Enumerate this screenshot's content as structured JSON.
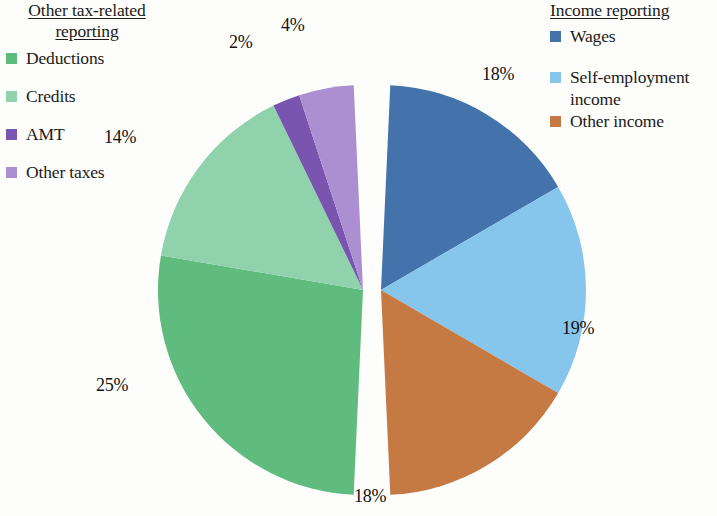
{
  "legend_left": {
    "title": "Other tax-related\nreporting",
    "items": [
      {
        "label": "Deductions",
        "color": "#60bb7e"
      },
      {
        "label": "Credits",
        "color": "#8fd2ac"
      },
      {
        "label": "AMT",
        "color": "#7a55b0"
      },
      {
        "label": "Other taxes",
        "color": "#ab8fd0"
      }
    ]
  },
  "legend_right": {
    "title": "Income reporting",
    "items": [
      {
        "label": "Wages",
        "color": "#4473ab"
      },
      {
        "label": "Self-employment\nincome",
        "color": "#86c5ec"
      },
      {
        "label": "Other income",
        "color": "#c57a44"
      }
    ]
  },
  "chart_data": {
    "type": "pie",
    "title": "",
    "legend_position": "left and right",
    "groups": [
      {
        "name": "Income reporting",
        "side": "right"
      },
      {
        "name": "Other tax-related reporting",
        "side": "left"
      }
    ],
    "categories": [
      "Wages",
      "Self-employment income",
      "Other income",
      "Deductions",
      "Credits",
      "AMT",
      "Other taxes"
    ],
    "values": [
      18,
      19,
      18,
      25,
      14,
      2,
      4
    ],
    "labels": [
      "18%",
      "19%",
      "18%",
      "25%",
      "14%",
      "2%",
      "4%"
    ],
    "colors": [
      "#4473ab",
      "#86c5ec",
      "#c57a44",
      "#60bb7e",
      "#8fd2ac",
      "#7a55b0",
      "#ab8fd0"
    ],
    "units": "percent",
    "total": 100
  },
  "pct_labels": [
    {
      "text": "18%",
      "x": 482,
      "y": 64,
      "name": "pct-label-wages"
    },
    {
      "text": "19%",
      "x": 562,
      "y": 318,
      "name": "pct-label-self-employment-income"
    },
    {
      "text": "18%",
      "x": 354,
      "y": 486,
      "name": "pct-label-other-income"
    },
    {
      "text": "25%",
      "x": 96,
      "y": 375,
      "name": "pct-label-deductions"
    },
    {
      "text": "14%",
      "x": 104,
      "y": 127,
      "name": "pct-label-credits"
    },
    {
      "text": "2%",
      "x": 229,
      "y": 32,
      "name": "pct-label-amt"
    },
    {
      "text": "4%",
      "x": 281,
      "y": 15,
      "name": "pct-label-other-taxes"
    }
  ]
}
